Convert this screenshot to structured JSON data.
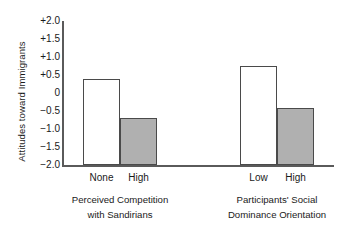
{
  "chart_data": {
    "type": "bar",
    "title": "",
    "xlabel": "",
    "ylabel": "Attitudes toward Immigrants",
    "ylim": [
      -2.0,
      2.0
    ],
    "ytick_labels": [
      "+2.0",
      "+1.5",
      "+1.0",
      "+0.5",
      "0",
      "−0.5",
      "−1.0",
      "−1.5",
      "−2.0"
    ],
    "ytick_values": [
      2.0,
      1.5,
      1.0,
      0.5,
      0,
      -0.5,
      -1.0,
      -1.5,
      -2.0
    ],
    "grid": false,
    "legend": "none",
    "bars_drawn_from": -2.0,
    "groups": [
      {
        "caption_line1": "Perceived Competition",
        "caption_line2": "with Sandirians",
        "categories": [
          "None",
          "High"
        ],
        "values": [
          0.4,
          -0.7
        ],
        "styles": [
          "open",
          "filled"
        ]
      },
      {
        "caption_line1": "Participants' Social",
        "caption_line2": "Dominance Orientation",
        "categories": [
          "Low",
          "High"
        ],
        "values": [
          0.75,
          -0.42
        ],
        "styles": [
          "open",
          "filled"
        ]
      }
    ],
    "colors": {
      "open_fill": "#ffffff",
      "filled_fill": "#b0b0b0",
      "bar_outline": "#4a4a4a",
      "axis": "#5a5a5a",
      "text": "#1a1a1a",
      "background": "#ffffff"
    }
  }
}
